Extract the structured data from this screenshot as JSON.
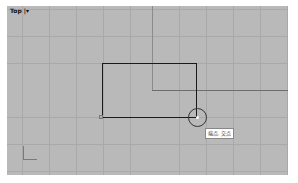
{
  "viewport": {
    "title": "Top",
    "title_suffix": " |▾",
    "background": "#b9b9b9",
    "grid_color": "#a9a9a9",
    "axis_color": "#6e6e6e"
  },
  "geometry": {
    "rectangle": {
      "left": 102,
      "top": 63,
      "right": 196,
      "bottom": 117,
      "color": "#1a1a1a"
    },
    "snap_point": {
      "x": 197,
      "y": 117,
      "radius": 9
    }
  },
  "snap_tooltip": {
    "text": "端点, 交点"
  },
  "icons": {
    "axis_icon": "world-axis-icon",
    "snap_icon": "osnap-circle-icon",
    "menu_icon": "viewport-menu-caret-icon"
  }
}
